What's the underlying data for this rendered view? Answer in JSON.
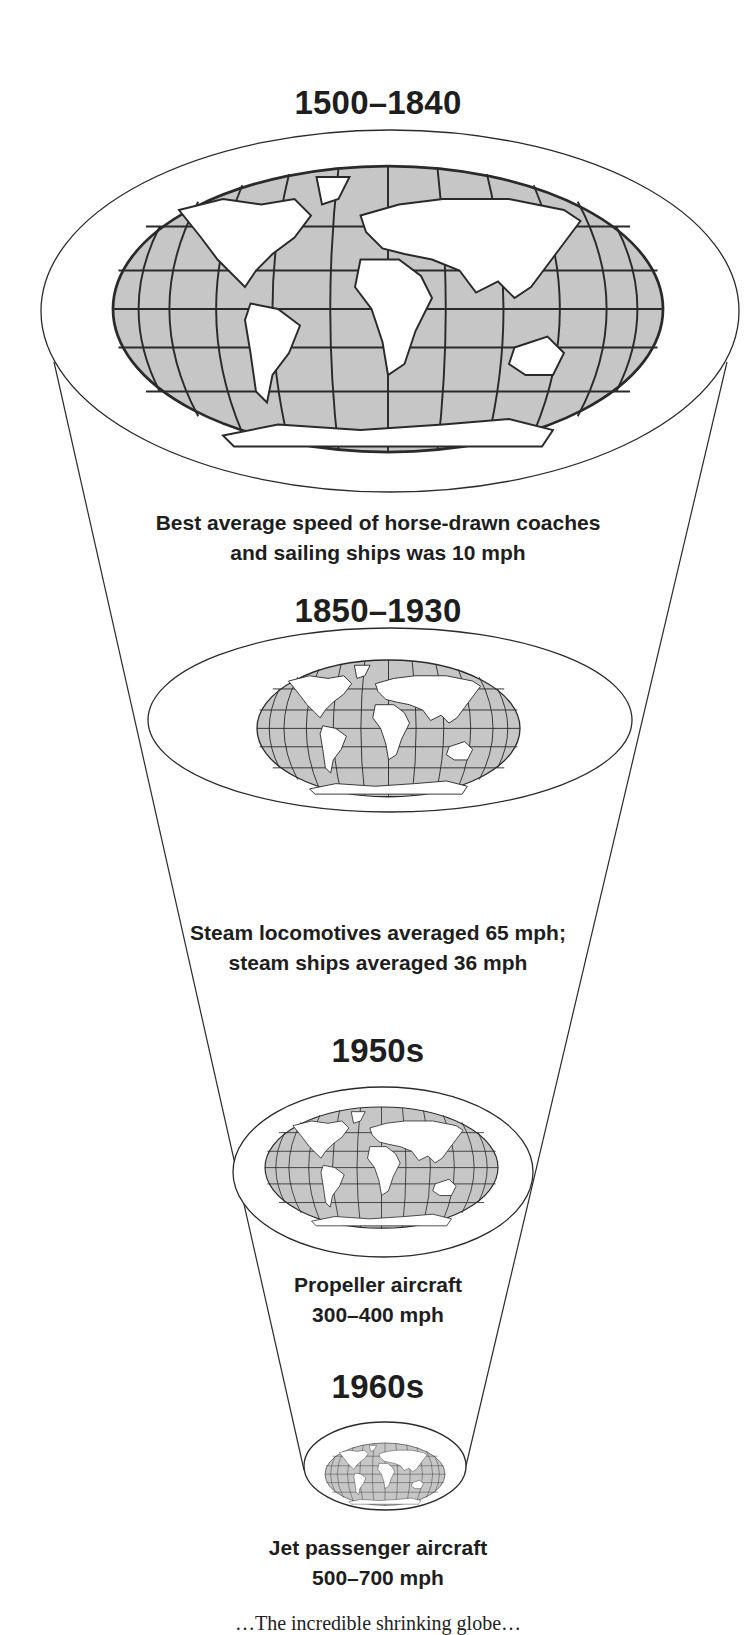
{
  "diagram": {
    "type": "shrinking-globe-funnel",
    "colors": {
      "ocean_fill": "#c6c6c6",
      "land_fill": "#ffffff",
      "line": "#2a2a2a",
      "text": "#1e1e1e"
    },
    "stages": [
      {
        "era": "1500–1840",
        "description_lines": [
          "Best average speed of horse-drawn coaches",
          "and sailing ships was 10 mph"
        ]
      },
      {
        "era": "1850–1930",
        "description_lines": [
          "Steam locomotives averaged 65 mph;",
          "steam ships averaged 36 mph"
        ]
      },
      {
        "era": "1950s",
        "description_lines": [
          "Propeller aircraft",
          "300–400 mph"
        ]
      },
      {
        "era": "1960s",
        "description_lines": [
          "Jet passenger aircraft",
          "500–700 mph"
        ]
      }
    ],
    "caption_clipped": "…The incredible shrinking globe…"
  }
}
